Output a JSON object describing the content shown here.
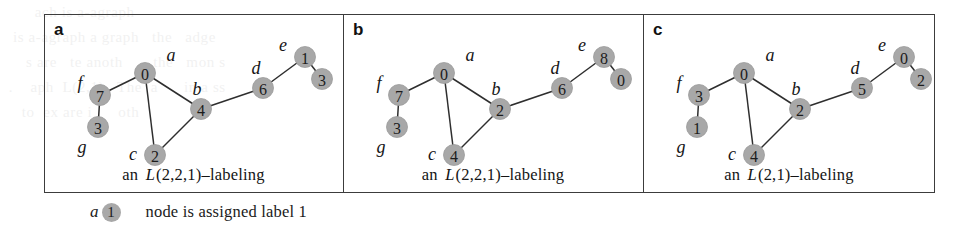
{
  "figure": {
    "legend": {
      "sample_node_name": "a",
      "sample_node_label": "1",
      "description": "node is assigned label 1"
    },
    "colors": {
      "node_fill": "#a8a8a8",
      "edge": "#2e2e2e",
      "frame": "#3c3c3c",
      "text": "#1a1a1a"
    },
    "panels": [
      {
        "letter": "a",
        "caption_prefix": "an",
        "caption_math": "L",
        "caption_suffix": "(2,2,1)–labeling",
        "nodes": [
          {
            "name": "a",
            "label": "0",
            "cx": 74,
            "cy": 47,
            "name_dx": 26,
            "name_dy": -18
          },
          {
            "name": "f",
            "label": "7",
            "cx": 29,
            "cy": 69,
            "name_dx": -20,
            "name_dy": -12
          },
          {
            "name": "g",
            "label": "3",
            "cx": 27,
            "cy": 101,
            "name_dx": -16,
            "name_dy": 20
          },
          {
            "name": "c",
            "label": "2",
            "cx": 84,
            "cy": 129,
            "name_dx": -22,
            "name_dy": -1
          },
          {
            "name": "b",
            "label": "4",
            "cx": 130,
            "cy": 83,
            "name_dx": -4,
            "name_dy": -20
          },
          {
            "name": "d",
            "label": "6",
            "cx": 192,
            "cy": 62,
            "name_dx": -7,
            "name_dy": -20
          },
          {
            "name": "e",
            "label": "1",
            "cx": 234,
            "cy": 31,
            "name_dx": -22,
            "name_dy": -12
          },
          {
            "name": "h",
            "label": "3",
            "cx": 251,
            "cy": 53,
            "name_dx": 29,
            "name_dy": -5
          }
        ],
        "edges": [
          [
            "f",
            "a"
          ],
          [
            "f",
            "g"
          ],
          [
            "a",
            "c"
          ],
          [
            "a",
            "b"
          ],
          [
            "c",
            "b"
          ],
          [
            "b",
            "d"
          ],
          [
            "d",
            "e"
          ],
          [
            "e",
            "h"
          ]
        ]
      },
      {
        "letter": "b",
        "caption_prefix": "an",
        "caption_math": "L",
        "caption_suffix": "(2,2,1)–labeling",
        "nodes": [
          {
            "name": "a",
            "label": "0",
            "cx": 74,
            "cy": 47,
            "name_dx": 26,
            "name_dy": -18
          },
          {
            "name": "f",
            "label": "7",
            "cx": 29,
            "cy": 69,
            "name_dx": -20,
            "name_dy": -12
          },
          {
            "name": "g",
            "label": "3",
            "cx": 27,
            "cy": 101,
            "name_dx": -16,
            "name_dy": 20
          },
          {
            "name": "c",
            "label": "4",
            "cx": 84,
            "cy": 129,
            "name_dx": -22,
            "name_dy": -1
          },
          {
            "name": "b",
            "label": "2",
            "cx": 130,
            "cy": 83,
            "name_dx": -4,
            "name_dy": -20
          },
          {
            "name": "d",
            "label": "6",
            "cx": 192,
            "cy": 62,
            "name_dx": -7,
            "name_dy": -20
          },
          {
            "name": "e",
            "label": "8",
            "cx": 234,
            "cy": 31,
            "name_dx": -22,
            "name_dy": -12
          },
          {
            "name": "h",
            "label": "0",
            "cx": 251,
            "cy": 53,
            "name_dx": 29,
            "name_dy": -5
          }
        ],
        "edges": [
          [
            "f",
            "a"
          ],
          [
            "f",
            "g"
          ],
          [
            "a",
            "c"
          ],
          [
            "a",
            "b"
          ],
          [
            "c",
            "b"
          ],
          [
            "b",
            "d"
          ],
          [
            "d",
            "e"
          ],
          [
            "e",
            "h"
          ]
        ]
      },
      {
        "letter": "c",
        "caption_prefix": "an",
        "caption_math": "L",
        "caption_suffix": "(2,1)–labeling",
        "nodes": [
          {
            "name": "a",
            "label": "0",
            "cx": 74,
            "cy": 47,
            "name_dx": 26,
            "name_dy": -18
          },
          {
            "name": "f",
            "label": "3",
            "cx": 29,
            "cy": 69,
            "name_dx": -20,
            "name_dy": -12
          },
          {
            "name": "g",
            "label": "1",
            "cx": 27,
            "cy": 101,
            "name_dx": -16,
            "name_dy": 20
          },
          {
            "name": "c",
            "label": "4",
            "cx": 84,
            "cy": 129,
            "name_dx": -22,
            "name_dy": -1
          },
          {
            "name": "b",
            "label": "2",
            "cx": 130,
            "cy": 83,
            "name_dx": -4,
            "name_dy": -20
          },
          {
            "name": "d",
            "label": "5",
            "cx": 192,
            "cy": 62,
            "name_dx": -7,
            "name_dy": -20
          },
          {
            "name": "e",
            "label": "0",
            "cx": 234,
            "cy": 31,
            "name_dx": -22,
            "name_dy": -12
          },
          {
            "name": "h",
            "label": "2",
            "cx": 251,
            "cy": 53,
            "name_dx": 29,
            "name_dy": -5
          }
        ],
        "edges": [
          [
            "f",
            "a"
          ],
          [
            "f",
            "g"
          ],
          [
            "a",
            "c"
          ],
          [
            "a",
            "b"
          ],
          [
            "c",
            "b"
          ],
          [
            "b",
            "d"
          ],
          [
            "d",
            "e"
          ],
          [
            "e",
            "h"
          ]
        ]
      }
    ],
    "panel_geometry": [
      {
        "left": 0,
        "width": 299
      },
      {
        "left": 299,
        "width": 300
      },
      {
        "left": 599,
        "width": 292
      }
    ]
  }
}
